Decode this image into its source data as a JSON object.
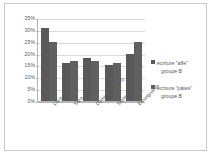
{
  "chart_data": {
    "type": "bar",
    "title": "",
    "subtitle": "",
    "xlabel": "",
    "ylabel": "",
    "ylim": [
      0,
      35
    ],
    "ytick_step": 5,
    "yticks": [
      "0%",
      "5%",
      "10%",
      "15%",
      "20%",
      "25%",
      "30%",
      "35%"
    ],
    "ytick_values": [
      0,
      5,
      10,
      15,
      20,
      25,
      30,
      35
    ],
    "grid": true,
    "legend_position": "right",
    "value_unit": "%",
    "categories": [
      "Luca",
      "Sara",
      "Demiano (target)",
      "Stefania",
      "Enseignante"
    ],
    "series": [
      {
        "name": "écriture \"affe\" groupe B",
        "name_line1": "écriture \"affe\"",
        "name_line2": "groupe B",
        "color": "#595959",
        "values": [
          31,
          16,
          18,
          15,
          20
        ]
      },
      {
        "name": "écriture \"pâtes\" groupe B",
        "name_line1": "écriture \"pâtes\"",
        "name_line2": "groupe B",
        "color": "#606060",
        "values": [
          25,
          17,
          17,
          16,
          25
        ]
      }
    ]
  },
  "colors": {
    "series1": "#595959",
    "series2": "#606060",
    "gridline": "#d9d9d9",
    "axis": "#b4b4b4",
    "border": "#c8c8c8",
    "text": "#5a5a5a",
    "background": "#ffffff"
  }
}
